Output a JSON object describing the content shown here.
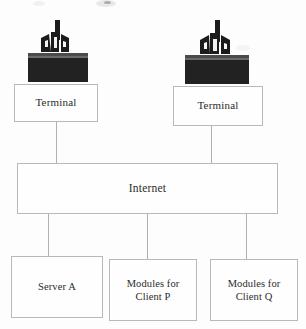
{
  "diagram": {
    "colors": {
      "background": "#fdfdfd",
      "box_fill": "#fefefe",
      "box_border": "#b9b9b9",
      "line": "#b0b0b0",
      "text": "#2b2b2b",
      "icon_dark": "#1c1c1c",
      "icon_base": "#262626"
    },
    "nodes": {
      "terminal_left": {
        "label": "Terminal"
      },
      "terminal_right": {
        "label": "Terminal"
      },
      "internet": {
        "label": "Internet"
      },
      "server_a": {
        "label": "Server A"
      },
      "client_p": {
        "label": "Modules for\nClient P"
      },
      "client_q": {
        "label": "Modules for\nClient Q"
      }
    },
    "icons": {
      "computer_left": "computer-terminal-icon",
      "computer_right": "computer-terminal-icon"
    },
    "connections": [
      {
        "from": "terminal_left",
        "to": "internet"
      },
      {
        "from": "terminal_right",
        "to": "internet"
      },
      {
        "from": "internet",
        "to": "server_a"
      },
      {
        "from": "internet",
        "to": "client_p"
      },
      {
        "from": "internet",
        "to": "client_q"
      }
    ]
  }
}
